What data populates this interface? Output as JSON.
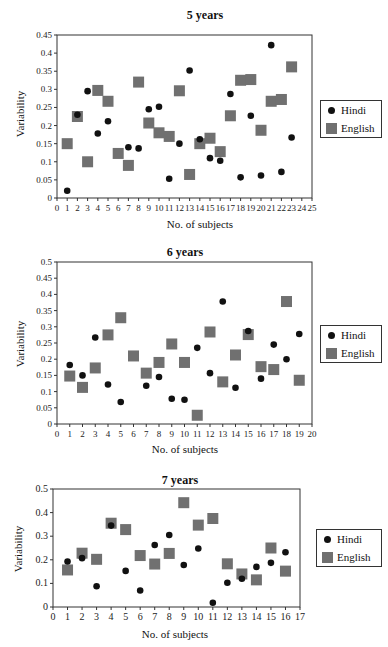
{
  "chart_data": [
    {
      "type": "scatter",
      "title": "5 years",
      "xlabel": "No. of subjects",
      "ylabel": "Variability",
      "xlim": [
        0,
        25
      ],
      "ylim": [
        0,
        0.45
      ],
      "yticks": [
        0,
        0.05,
        0.1,
        0.15,
        0.2,
        0.25,
        0.3,
        0.35,
        0.4,
        0.45
      ],
      "ytick_labels": [
        "0",
        "0.05",
        "0.1",
        "0.15",
        "0.2",
        "0.25",
        "0.3",
        "0.35",
        "0.4",
        "0.45"
      ],
      "xticks": [
        0,
        1,
        2,
        3,
        4,
        5,
        6,
        7,
        8,
        9,
        10,
        11,
        12,
        13,
        14,
        15,
        16,
        17,
        18,
        19,
        20,
        21,
        22,
        23,
        24,
        25
      ],
      "grid": false,
      "legend_position": "right",
      "series": [
        {
          "name": "Hindi",
          "marker": "circle",
          "color": "#111111",
          "x": [
            1,
            2,
            3,
            4,
            5,
            7,
            8,
            9,
            10,
            11,
            12,
            13,
            14,
            15,
            16,
            17,
            18,
            19,
            20,
            21,
            22,
            23
          ],
          "y": [
            0.02,
            0.23,
            0.295,
            0.178,
            0.212,
            0.14,
            0.137,
            0.245,
            0.252,
            0.053,
            0.15,
            0.352,
            0.162,
            0.11,
            0.103,
            0.287,
            0.057,
            0.227,
            0.062,
            0.422,
            0.072,
            0.167
          ]
        },
        {
          "name": "English",
          "marker": "square",
          "color": "#707070",
          "x": [
            1,
            2,
            3,
            4,
            5,
            6,
            7,
            8,
            9,
            10,
            11,
            12,
            13,
            14,
            15,
            16,
            17,
            18,
            19,
            20,
            21,
            22,
            23
          ],
          "y": [
            0.15,
            0.225,
            0.1,
            0.297,
            0.267,
            0.123,
            0.09,
            0.32,
            0.207,
            0.18,
            0.17,
            0.296,
            0.065,
            0.15,
            0.165,
            0.128,
            0.227,
            0.325,
            0.327,
            0.187,
            0.267,
            0.272,
            0.362
          ]
        }
      ]
    },
    {
      "type": "scatter",
      "title": "6 years",
      "xlabel": "No. of subjects",
      "ylabel": "Variability",
      "xlim": [
        0,
        20
      ],
      "ylim": [
        0,
        0.5
      ],
      "yticks": [
        0,
        0.05,
        0.1,
        0.15,
        0.2,
        0.25,
        0.3,
        0.35,
        0.4,
        0.45,
        0.5
      ],
      "ytick_labels": [
        "0",
        "0.05",
        "0.1",
        "0.15",
        "0.2",
        "0.25",
        "0.3",
        "0.35",
        "0.4",
        "0.45",
        "0.5"
      ],
      "xticks": [
        0,
        1,
        2,
        3,
        4,
        5,
        6,
        7,
        8,
        9,
        10,
        11,
        12,
        13,
        14,
        15,
        16,
        17,
        18,
        19,
        20
      ],
      "grid": false,
      "legend_position": "right",
      "series": [
        {
          "name": "Hindi",
          "marker": "circle",
          "color": "#111111",
          "x": [
            1,
            2,
            3,
            4,
            5,
            7,
            8,
            9,
            10,
            11,
            12,
            13,
            14,
            15,
            16,
            17,
            18,
            19
          ],
          "y": [
            0.182,
            0.15,
            0.267,
            0.122,
            0.068,
            0.118,
            0.145,
            0.078,
            0.075,
            0.235,
            0.157,
            0.378,
            0.112,
            0.287,
            0.14,
            0.245,
            0.2,
            0.278
          ]
        },
        {
          "name": "English",
          "marker": "square",
          "color": "#707070",
          "x": [
            1,
            2,
            3,
            4,
            5,
            6,
            7,
            8,
            9,
            10,
            11,
            12,
            13,
            14,
            15,
            16,
            17,
            18,
            19
          ],
          "y": [
            0.148,
            0.113,
            0.173,
            0.275,
            0.328,
            0.21,
            0.157,
            0.19,
            0.247,
            0.19,
            0.027,
            0.284,
            0.13,
            0.213,
            0.276,
            0.177,
            0.168,
            0.378,
            0.135
          ]
        }
      ]
    },
    {
      "type": "scatter",
      "title": "7 years",
      "xlabel": "No. of subjects",
      "ylabel": "Variability",
      "xlim": [
        0,
        17
      ],
      "ylim": [
        0,
        0.5
      ],
      "yticks": [
        0,
        0.1,
        0.2,
        0.3,
        0.4,
        0.5
      ],
      "ytick_labels": [
        "0",
        "0.1",
        "0.2",
        "0.3",
        "0.4",
        "0.5"
      ],
      "xticks": [
        0,
        1,
        2,
        3,
        4,
        5,
        6,
        7,
        8,
        9,
        10,
        11,
        12,
        13,
        14,
        15,
        16,
        17
      ],
      "grid": false,
      "legend_position": "right",
      "series": [
        {
          "name": "Hindi",
          "marker": "circle",
          "color": "#111111",
          "x": [
            1,
            2,
            3,
            4,
            5,
            6,
            7,
            8,
            9,
            10,
            11,
            12,
            13,
            14,
            15,
            16
          ],
          "y": [
            0.193,
            0.207,
            0.088,
            0.345,
            0.153,
            0.07,
            0.263,
            0.305,
            0.178,
            0.248,
            0.018,
            0.103,
            0.12,
            0.17,
            0.187,
            0.232
          ]
        },
        {
          "name": "English",
          "marker": "square",
          "color": "#707070",
          "x": [
            1,
            2,
            3,
            4,
            5,
            6,
            7,
            8,
            9,
            10,
            11,
            12,
            13,
            14,
            15,
            16
          ],
          "y": [
            0.157,
            0.228,
            0.202,
            0.355,
            0.328,
            0.218,
            0.182,
            0.227,
            0.442,
            0.347,
            0.375,
            0.183,
            0.14,
            0.115,
            0.25,
            0.152
          ]
        }
      ]
    }
  ],
  "charts": [
    {
      "title": "5 years",
      "xlabel": "No. of subjects",
      "ylabel": "Variability",
      "legend": [
        "Hindi",
        "English"
      ]
    },
    {
      "title": "6 years",
      "xlabel": "No. of subjects",
      "ylabel": "Variability",
      "legend": [
        "Hindi",
        "English"
      ]
    },
    {
      "title": "7 years",
      "xlabel": "No. of subjects",
      "ylabel": "Variability",
      "legend": [
        "Hindi",
        "English"
      ]
    }
  ]
}
